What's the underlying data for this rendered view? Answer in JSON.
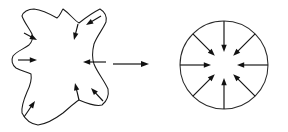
{
  "figure": {
    "background_color": "#ffffff",
    "stroke_color": "#111111",
    "width": 288,
    "height": 132,
    "caption": ""
  },
  "left_panel": {
    "name": "irregular-blob",
    "description": "Closed irregular four-lobed star-like curve with inward pointing arrows",
    "bounds": {
      "x": 12,
      "y": 8,
      "width": 98,
      "height": 118
    },
    "outline_path": "M 63 9 C 70 14 74 20 79 23 C 84 19 92 13 100 9 C 105 12 107 17 106 22 C 103 29 97 36 94 44 C 92 52 92 58 94 64 C 97 72 104 80 108 89 C 109 95 107 101 102 105 C 95 107 86 103 79 100 C 74 103 69 108 63 113 C 55 119 46 124 38 125 C 31 124 25 119 22 113 C 21 106 24 99 27 92 C 30 86 32 80 31 74 C 27 72 21 71 16 68 C 12 65 11 60 13 56 C 17 51 24 49 29 45 C 32 42 33 38 32 34 C 29 28 24 22 22 16 C 23 12 28 9 34 9 C 42 10 50 14 57 18 C 60 16 61 12 63 9 Z",
    "arrows": [
      {
        "name": "blob-normal-1",
        "x1": 24,
        "y1": 33,
        "x2": 37,
        "y2": 40,
        "label": "inward normal"
      },
      {
        "name": "blob-normal-2",
        "x1": 78,
        "y1": 24,
        "x2": 74,
        "y2": 40,
        "label": "inward normal"
      },
      {
        "name": "blob-normal-3",
        "x1": 101,
        "y1": 16,
        "x2": 86,
        "y2": 25,
        "label": "inward normal"
      },
      {
        "name": "blob-normal-4",
        "x1": 18,
        "y1": 60,
        "x2": 37,
        "y2": 60,
        "label": "inward normal"
      },
      {
        "name": "blob-normal-5",
        "x1": 106,
        "y1": 62,
        "x2": 83,
        "y2": 62,
        "label": "inward normal"
      },
      {
        "name": "blob-normal-6",
        "x1": 79,
        "y1": 100,
        "x2": 75,
        "y2": 83,
        "label": "inward normal"
      },
      {
        "name": "blob-normal-7",
        "x1": 103,
        "y1": 101,
        "x2": 91,
        "y2": 88,
        "label": "inward normal"
      },
      {
        "name": "blob-normal-8",
        "x1": 24,
        "y1": 117,
        "x2": 35,
        "y2": 101,
        "label": "inward normal"
      }
    ]
  },
  "transition": {
    "name": "transition-arrow",
    "symbol": "right-arrow",
    "label": "",
    "x1": 113,
    "y1": 64,
    "x2": 149,
    "y2": 64
  },
  "right_panel": {
    "name": "unit-circle",
    "description": "Circle with eight evenly spaced radial arrows pointing inward to the center",
    "center": {
      "x": 224,
      "y": 65
    },
    "radius": 44,
    "arrow_count": 8,
    "arrow_inner_radius": 13,
    "arrows": [
      {
        "name": "circle-normal-n",
        "angle_deg": 90,
        "label": "inward radial"
      },
      {
        "name": "circle-normal-ne",
        "angle_deg": 45,
        "label": "inward radial"
      },
      {
        "name": "circle-normal-e",
        "angle_deg": 0,
        "label": "inward radial"
      },
      {
        "name": "circle-normal-se",
        "angle_deg": 315,
        "label": "inward radial"
      },
      {
        "name": "circle-normal-s",
        "angle_deg": 270,
        "label": "inward radial"
      },
      {
        "name": "circle-normal-sw",
        "angle_deg": 225,
        "label": "inward radial"
      },
      {
        "name": "circle-normal-w",
        "angle_deg": 180,
        "label": "inward radial"
      },
      {
        "name": "circle-normal-nw",
        "angle_deg": 135,
        "label": "inward radial"
      }
    ]
  }
}
